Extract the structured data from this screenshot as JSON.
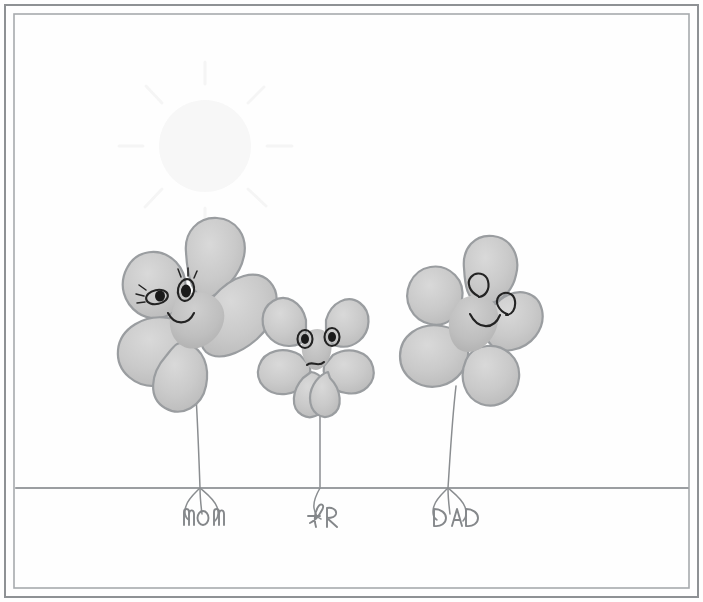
{
  "artwork": {
    "title": "Child's crayon drawing of a clover family",
    "medium": "pencil and colored pencil on paper",
    "background_color": "#fefefe",
    "frame": {
      "style": "double-line rectangular border",
      "outer_color": "#8e9194",
      "inner_color": "#a7aaad"
    },
    "ground": {
      "name": "ground-line",
      "color": "#9b9ea1",
      "y": 488
    },
    "sun": {
      "name": "sun",
      "visible": true,
      "description": "very faint sun with rays, upper left sky",
      "center_x": 205,
      "center_y": 146,
      "radius": 46,
      "color": "#f6f6f6",
      "ray_count": 8
    },
    "figures": [
      {
        "id": "clover-mom",
        "label": "MOM",
        "size": "large",
        "leaf_color": "#cccccc",
        "leaf_shade": "#bcbcbc",
        "outline_color": "#9a9da0",
        "expression": "smiling",
        "eyes": "almond eyes with eyelashes",
        "mouth": "smile",
        "center_x": 188,
        "center_y": 330,
        "stem_bottom_y": 488
      },
      {
        "id": "clover-child",
        "label": "FR",
        "size": "small",
        "leaf_color": "#cccccc",
        "leaf_shade": "#bcbcbc",
        "outline_color": "#9a9da0",
        "expression": "neutral",
        "eyes": "round open eyes",
        "mouth": "slight wavy frown",
        "center_x": 320,
        "center_y": 360,
        "stem_bottom_y": 488
      },
      {
        "id": "clover-dad",
        "label": "DAD",
        "size": "large",
        "leaf_color": "#cccccc",
        "leaf_shade": "#bcbcbc",
        "outline_color": "#9a9da0",
        "expression": "smiling",
        "eyes": "spiral swirl eyes",
        "mouth": "smile",
        "center_x": 468,
        "center_y": 322,
        "stem_bottom_y": 488
      }
    ],
    "labels": [
      {
        "name": "label-mom",
        "text": "MOM",
        "x": 200,
        "y": 518
      },
      {
        "name": "label-child",
        "text": "FR",
        "x": 322,
        "y": 516
      },
      {
        "name": "label-dad",
        "text": "DAD",
        "x": 452,
        "y": 518
      }
    ],
    "colors": {
      "paper": "#fefefe",
      "pencil": "#8a8d90",
      "ink": "#232323",
      "leaf": "#cccccc"
    }
  }
}
